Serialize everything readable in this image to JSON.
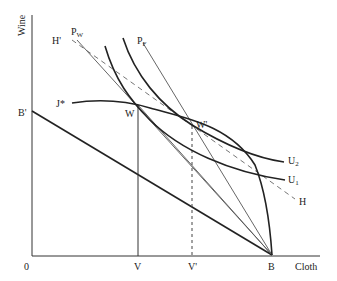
{
  "diagram": {
    "type": "economics-trade-diagram",
    "axes": {
      "y_label": "Wine",
      "x_label": "Cloth",
      "origin_label": "0"
    },
    "points": {
      "B_prime": "B'",
      "B": "B",
      "V": "V",
      "V_prime": "V'",
      "W": "W",
      "W_prime": "W'",
      "J_star": "J*"
    },
    "lines": {
      "P_W": {
        "main": "P",
        "sub": "W"
      },
      "P_F": {
        "main": "P",
        "sub": "F"
      },
      "H_prime": "H'",
      "H": "H"
    },
    "curves": {
      "U1": {
        "main": "U",
        "sub": "1"
      },
      "U2": {
        "main": "U",
        "sub": "2"
      }
    },
    "colors": {
      "ink": "#222222",
      "thin": "#555555",
      "background": "#ffffff"
    }
  }
}
